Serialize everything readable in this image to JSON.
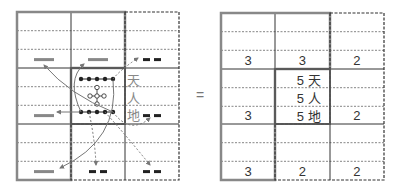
{
  "left_grid": {
    "yang_bar_color": "#888888",
    "yin_bar_color": "#222222",
    "labels": {
      "heaven": "天",
      "human": "人",
      "earth": "地"
    },
    "cells": [
      {
        "row": 0,
        "col": 0,
        "line": "yang"
      },
      {
        "row": 0,
        "col": 1,
        "line": "yang"
      },
      {
        "row": 0,
        "col": 2,
        "line": "yin"
      },
      {
        "row": 1,
        "col": 0,
        "line": "yang"
      },
      {
        "row": 1,
        "col": 2,
        "line": "yin"
      },
      {
        "row": 2,
        "col": 0,
        "line": "yang"
      },
      {
        "row": 2,
        "col": 1,
        "line": "yin"
      },
      {
        "row": 2,
        "col": 2,
        "line": "yin"
      }
    ]
  },
  "operator": "=",
  "right_grid": {
    "cells": [
      {
        "row": 0,
        "col": 0,
        "value": "3"
      },
      {
        "row": 0,
        "col": 1,
        "value": "3"
      },
      {
        "row": 0,
        "col": 2,
        "value": "2"
      },
      {
        "row": 1,
        "col": 0,
        "value": "3"
      },
      {
        "row": 1,
        "col": 2,
        "value": "2"
      },
      {
        "row": 2,
        "col": 0,
        "value": "3"
      },
      {
        "row": 2,
        "col": 1,
        "value": "2"
      },
      {
        "row": 2,
        "col": 2,
        "value": "2"
      }
    ],
    "center": [
      {
        "value": "5",
        "label": "天"
      },
      {
        "value": "5",
        "label": "人"
      },
      {
        "value": "5",
        "label": "地"
      }
    ]
  }
}
